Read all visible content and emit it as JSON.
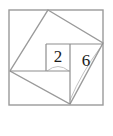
{
  "figure": {
    "background_color": "#ffffff",
    "line_color": "#9a9a9a",
    "inner_line_color": "#8e8e8e",
    "faint_line_color": "#c3c3c3",
    "label_color": "#1a1a1a",
    "labels": [
      {
        "id": "label-2",
        "text": "2",
        "x": 58,
        "y": 58
      },
      {
        "id": "label-6",
        "text": "6",
        "x": 86,
        "y": 62
      }
    ],
    "outer_square": {
      "name": "outer-square",
      "x": 9,
      "y": 10,
      "width": 94,
      "height": 95,
      "left": 9,
      "top": 10,
      "right": 103,
      "bottom": 105
    },
    "tilted_square": {
      "name": "tilted-square",
      "points": "48,10 103,43 70,104 10,71",
      "vertices": [
        {
          "id": "vertex-top",
          "x": 48,
          "y": 10
        },
        {
          "id": "vertex-right",
          "x": 103,
          "y": 43
        },
        {
          "id": "vertex-bottom",
          "x": 70,
          "y": 104
        },
        {
          "id": "vertex-left",
          "x": 10,
          "y": 71
        }
      ]
    },
    "diagonals": [
      {
        "id": "diagonal-top-left",
        "x1": 48,
        "y1": 10,
        "x2": 10,
        "y2": 71
      },
      {
        "id": "diagonal-top-right",
        "x1": 48,
        "y1": 10,
        "x2": 103,
        "y2": 43
      },
      {
        "id": "diagonal-left-bottom",
        "x1": 10,
        "y1": 71,
        "x2": 70,
        "y2": 104
      },
      {
        "id": "diagonal-right-bottom",
        "x1": 103,
        "y1": 43,
        "x2": 70,
        "y2": 104
      }
    ],
    "inner_lines": [
      {
        "id": "inner-horizontal-upper",
        "x1": 46,
        "y1": 44,
        "x2": 103,
        "y2": 44
      },
      {
        "id": "inner-horizontal-lower",
        "x1": 10,
        "y1": 71,
        "x2": 70,
        "y2": 71
      },
      {
        "id": "inner-vertical-left",
        "x1": 46,
        "y1": 44,
        "x2": 46,
        "y2": 71
      },
      {
        "id": "inner-vertical-right",
        "x1": 70,
        "y1": 44,
        "x2": 70,
        "y2": 104
      }
    ],
    "rect_2": {
      "name": "rectangle-area-2",
      "x": 46,
      "y": 44,
      "width": 24,
      "height": 27
    },
    "rect_6": {
      "name": "rectangle-area-6",
      "x": 70,
      "y": 44,
      "width": 33,
      "height": 27
    },
    "faint_arcs": [
      {
        "id": "arc-under-2",
        "d": "M 47 71 Q 58 62 69 71"
      },
      {
        "id": "arc-lower-right",
        "d": "M 70 100 Q 82 72 100 48"
      }
    ]
  }
}
